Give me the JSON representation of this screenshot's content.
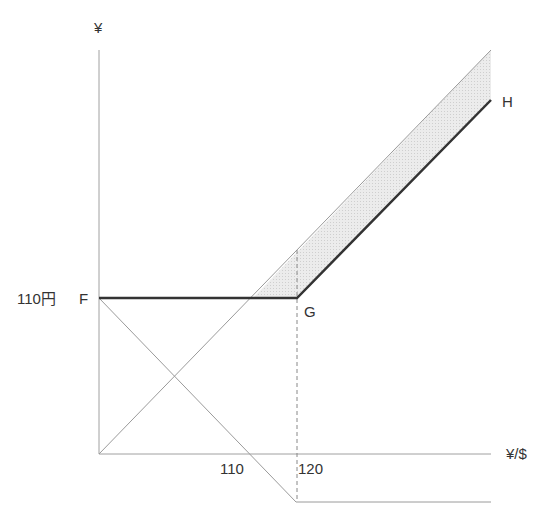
{
  "diagram": {
    "y_axis_label": "¥",
    "x_axis_label": "¥/$",
    "strike_label": "110円",
    "point_f": "F",
    "point_g": "G",
    "point_h": "H",
    "x_tick_110": "110",
    "x_tick_120": "120",
    "colors": {
      "axis": "#999999",
      "bold_payoff": "#333333",
      "thin_line": "#aaaaaa",
      "shade": "#e6e6e6",
      "dashed": "#888888",
      "text": "#333333"
    }
  }
}
